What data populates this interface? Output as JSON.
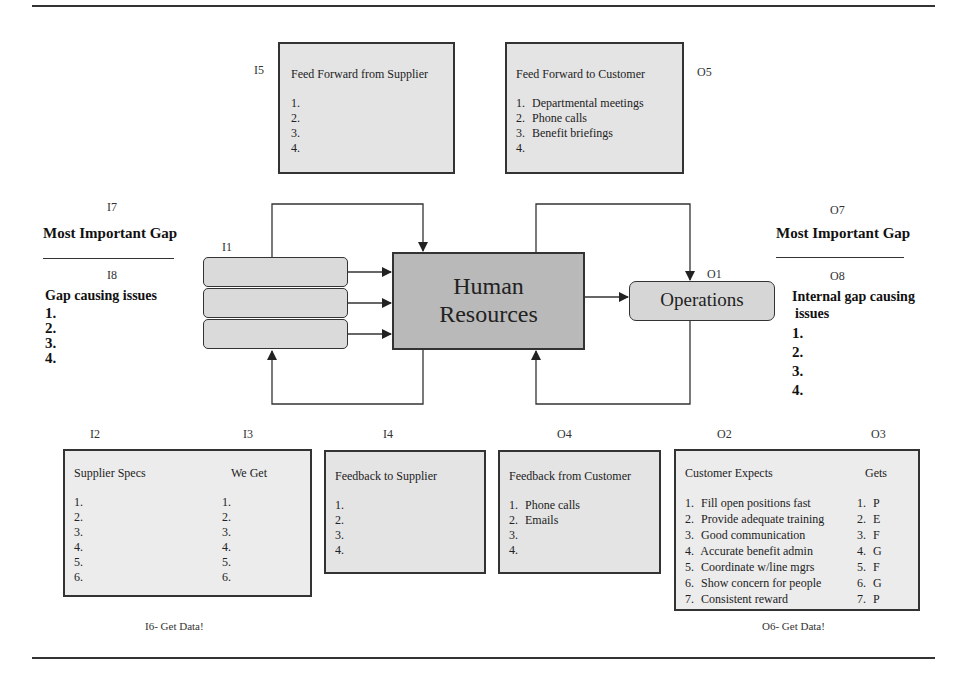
{
  "labels": {
    "i1": "I1",
    "i2": "I2",
    "i3": "I3",
    "i4": "I4",
    "i5": "I5",
    "i7": "I7",
    "i8": "I8",
    "o1": "O1",
    "o2": "O2",
    "o3": "O3",
    "o4": "O4",
    "o5": "O5",
    "o7": "O7",
    "o8": "O8"
  },
  "center": {
    "hr_line1": "Human",
    "hr_line2": "Resources",
    "operations": "Operations"
  },
  "feed_forward_supplier": {
    "title": "Feed Forward from Supplier",
    "items": [
      "1.",
      "2.",
      "3.",
      "4."
    ]
  },
  "feed_forward_customer": {
    "title": "Feed Forward to Customer",
    "items": [
      {
        "n": "1.",
        "text": "Departmental meetings"
      },
      {
        "n": "2.",
        "text": "Phone calls"
      },
      {
        "n": "3.",
        "text": "Benefit briefings"
      },
      {
        "n": "4.",
        "text": ""
      }
    ]
  },
  "left_gap": {
    "title": "Most Important Gap",
    "subtitle": "Gap causing issues",
    "items": [
      "1.",
      "2.",
      "3.",
      "4."
    ]
  },
  "right_gap": {
    "title": "Most Important Gap",
    "subtitle_line1": "Internal gap causing",
    "subtitle_line2": "issues",
    "items": [
      "1.",
      "2.",
      "3.",
      "4."
    ]
  },
  "supplier_specs": {
    "col1_title": "Supplier Specs",
    "col2_title": "We Get",
    "col1_items": [
      "1.",
      "2.",
      "3.",
      "4.",
      "5.",
      "6."
    ],
    "col2_items": [
      "1.",
      "2.",
      "3.",
      "4.",
      "5.",
      "6."
    ],
    "footer": "I6- Get Data!"
  },
  "feedback_supplier": {
    "title": "Feedback to Supplier",
    "items": [
      "1.",
      "2.",
      "3.",
      "4."
    ]
  },
  "feedback_customer": {
    "title": "Feedback from Customer",
    "items": [
      {
        "n": "1.",
        "text": "Phone calls"
      },
      {
        "n": "2.",
        "text": "Emails"
      },
      {
        "n": "3.",
        "text": ""
      },
      {
        "n": "4.",
        "text": ""
      }
    ]
  },
  "customer_expects": {
    "col1_title": "Customer Expects",
    "col2_title": "Gets",
    "expects": [
      {
        "n": "1.",
        "text": "Fill open positions fast"
      },
      {
        "n": "2.",
        "text": "Provide adequate training"
      },
      {
        "n": "3.",
        "text": "Good communication"
      },
      {
        "n": "4.",
        "text": "Accurate benefit admin"
      },
      {
        "n": "5.",
        "text": "Coordinate w/line mgrs"
      },
      {
        "n": "6.",
        "text": "Show concern for people"
      },
      {
        "n": "7.",
        "text": "Consistent reward"
      }
    ],
    "gets": [
      {
        "n": "1.",
        "text": "P"
      },
      {
        "n": "2.",
        "text": "E"
      },
      {
        "n": "3.",
        "text": "F"
      },
      {
        "n": "4.",
        "text": "G"
      },
      {
        "n": "5.",
        "text": "F"
      },
      {
        "n": "6.",
        "text": "G"
      },
      {
        "n": "7.",
        "text": "P"
      }
    ],
    "footer": "O6- Get Data!"
  }
}
